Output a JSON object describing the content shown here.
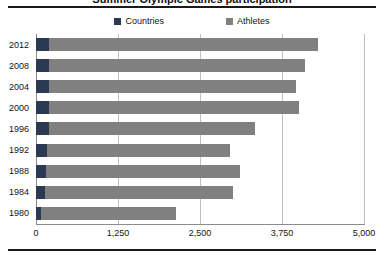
{
  "chart_data": {
    "type": "bar",
    "orientation": "horizontal",
    "stacked": true,
    "title": "Summer Olympic Games participation",
    "categories": [
      "2012",
      "2008",
      "2004",
      "2000",
      "1996",
      "1992",
      "1988",
      "1984",
      "1980"
    ],
    "series": [
      {
        "name": "Countries",
        "color": "#2b3a52",
        "values": [
          204,
          204,
          201,
          199,
          197,
          169,
          159,
          140,
          80
        ]
      },
      {
        "name": "Athletes",
        "color": "#808080",
        "values": [
          4096,
          3896,
          3759,
          3812,
          3143,
          2791,
          2951,
          2860,
          2050
        ]
      }
    ],
    "totals": [
      4300,
      4100,
      3960,
      4011,
      3340,
      2960,
      3110,
      3000,
      2130
    ],
    "xlabel": "",
    "ylabel": "",
    "xlim": [
      0,
      5000
    ],
    "xticks": [
      0,
      1250,
      2500,
      3750,
      5000
    ],
    "xtick_labels": [
      "0",
      "1,250",
      "2,500",
      "3,750",
      "5,000"
    ],
    "grid": "vertical",
    "legend_position": "top-center"
  },
  "legend": {
    "items": [
      {
        "label": "Countries",
        "color": "#2b3a52"
      },
      {
        "label": "Athletes",
        "color": "#808080"
      }
    ]
  },
  "axes": {
    "y_labels": [
      "2012",
      "2008",
      "2004",
      "2000",
      "1996",
      "1992",
      "1988",
      "1984",
      "1980"
    ],
    "x_labels": [
      "0",
      "1,250",
      "2,500",
      "3,750",
      "5,000"
    ]
  }
}
